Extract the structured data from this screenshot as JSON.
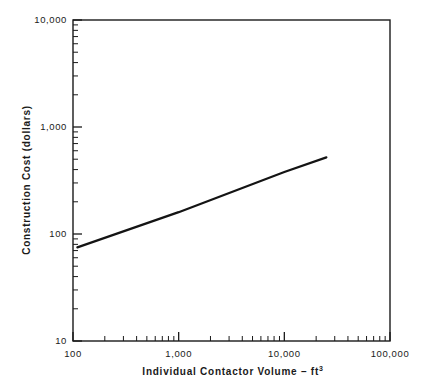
{
  "figure": {
    "background_color": "#ffffff",
    "line_color": "#141414",
    "axis_color": "#1a1a1a",
    "width": 423,
    "height": 388
  },
  "chart_data": {
    "type": "line",
    "title": "",
    "subtitle": "",
    "xlabel": "Individual Contactor Volume – ft",
    "xlabel_superscript": "3",
    "xlabel_full": "Individual Contactor Volume – ft3",
    "ylabel": "Construction Cost (dollars)",
    "xscale": "log",
    "yscale": "log",
    "xlim": [
      100,
      100000
    ],
    "ylim": [
      10,
      10000
    ],
    "grid": false,
    "legend": false,
    "legend_position": "none",
    "x_tick_labels": [
      "100",
      "1,000",
      "10,000",
      "100,000"
    ],
    "x_tick_values": [
      100,
      1000,
      10000,
      100000
    ],
    "y_tick_labels": [
      "10",
      "100",
      "1,000",
      "10,000"
    ],
    "y_tick_values": [
      10,
      100,
      1000,
      10000
    ],
    "minor_ticks": true,
    "minor_tick_multipliers": [
      2,
      3,
      4,
      5,
      6,
      7,
      8,
      9
    ],
    "series": [
      {
        "name": "Construction cost",
        "x": [
          110,
          1000,
          10000,
          25000
        ],
        "y": [
          75,
          160,
          380,
          520
        ],
        "x_start": 110,
        "y_start": 75,
        "x_end": 25000,
        "y_end": 520,
        "slope_loglog": 0.355,
        "style": "solid",
        "color": "#141414"
      }
    ],
    "annotations": []
  }
}
